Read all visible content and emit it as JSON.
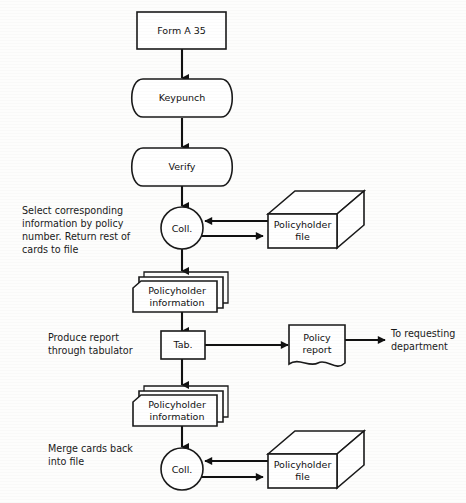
{
  "diagram": {
    "background_color": "#fdfdfc",
    "line_color": "#111111",
    "nodes": {
      "form": {
        "label": "Form A 35",
        "shape": "rectangle"
      },
      "keypunch": {
        "label": "Keypunch",
        "shape": "stadium"
      },
      "verify": {
        "label": "Verify",
        "shape": "stadium"
      },
      "collate_top": {
        "label": "Coll.",
        "shape": "circle"
      },
      "file_top": {
        "label_line1": "Policyholder",
        "label_line2": "file",
        "shape": "3d-box"
      },
      "cards_top": {
        "label_line1": "Policyholder",
        "label_line2": "information",
        "shape": "card-stack"
      },
      "tabulate": {
        "label": "Tab.",
        "shape": "square"
      },
      "report": {
        "label_line1": "Policy",
        "label_line2": "report",
        "shape": "document"
      },
      "cards_bottom": {
        "label_line1": "Policyholder",
        "label_line2": "information",
        "shape": "card-stack"
      },
      "collate_bottom": {
        "label": "Coll.",
        "shape": "circle"
      },
      "file_bottom": {
        "label_line1": "Policyholder",
        "label_line2": "file",
        "shape": "3d-box"
      }
    },
    "annotations": {
      "select": {
        "lines": [
          "Select corresponding",
          "information by policy",
          "number. Return rest of",
          "cards to file"
        ]
      },
      "produce": {
        "lines": [
          "Produce report",
          "through tabulator"
        ]
      },
      "merge": {
        "lines": [
          "Merge cards back",
          "into file"
        ]
      },
      "destination": {
        "lines": [
          "To requesting",
          "department"
        ]
      }
    }
  }
}
